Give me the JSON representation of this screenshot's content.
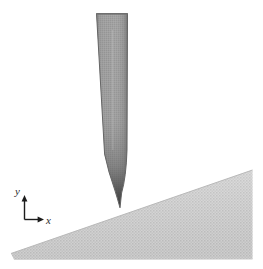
{
  "figure": {
    "kind": "schematic-diagram",
    "background_color": "#ffffff"
  },
  "axes": {
    "name": "coordinate-axis-indicator",
    "origin": {
      "x": 24,
      "y": 219
    },
    "y_axis": {
      "label": "y",
      "label_position": {
        "x": 15,
        "y": 186
      },
      "from": {
        "x": 24,
        "y": 219
      },
      "to": {
        "x": 24,
        "y": 196
      },
      "arrow": "up"
    },
    "x_axis": {
      "label": "x",
      "label_position": {
        "x": 46,
        "y": 215
      },
      "from": {
        "x": 24,
        "y": 219
      },
      "to": {
        "x": 44,
        "y": 219
      },
      "arrow": "right"
    },
    "line_color": "#1c1c1c",
    "line_width": 1.3
  },
  "probe": {
    "name": "probe-tip",
    "shaft_fill": "#9b9b9b",
    "shaft_edge": "#6f6f6f",
    "tip_fill_dark": "#474747",
    "outline_color": "#5c5c5c",
    "top_y": 13,
    "left_x": 96,
    "right_x": 128,
    "apex": {
      "x": 120,
      "y": 208
    },
    "taper_start_y": 150
  },
  "wedge": {
    "name": "inclined-wedge-surface",
    "fill": "#c9c9c9",
    "edge_color": "#b4b4b4",
    "stipple": true,
    "left_apex": {
      "x": 11,
      "y": 253
    },
    "top_right": {
      "x": 252,
      "y": 170
    },
    "bottom_right": {
      "x": 252,
      "y": 259
    },
    "slope_degrees": 19
  },
  "colors": {
    "probe_gray": "#9b9b9b",
    "probe_dark": "#474747",
    "wedge_gray": "#c9c9c9",
    "axis_black": "#1c1c1c",
    "page_white": "#ffffff"
  }
}
